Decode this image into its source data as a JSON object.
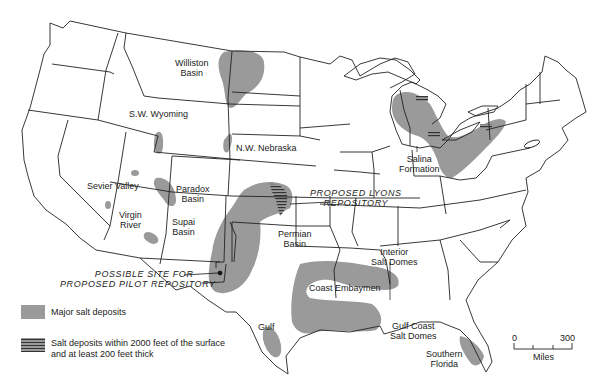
{
  "map": {
    "title": "Salt deposits of the United States",
    "fill_color": "#9a9a9a",
    "hatch_color": "#333333",
    "regions": [
      {
        "id": "williston",
        "label": "Williston\nBasin",
        "lines": [
          "Williston",
          "Basin"
        ]
      },
      {
        "id": "sw-wyoming",
        "label": "S.W. Wyoming"
      },
      {
        "id": "nw-nebraska",
        "label": "N.W. Nebraska"
      },
      {
        "id": "sevier-valley",
        "label": "Sevier Valley"
      },
      {
        "id": "paradox",
        "lines": [
          "Paradox",
          "Basin"
        ]
      },
      {
        "id": "virgin-river",
        "lines": [
          "Virgin",
          "River"
        ]
      },
      {
        "id": "supai",
        "lines": [
          "Supai",
          "Basin"
        ]
      },
      {
        "id": "permian",
        "lines": [
          "Permian",
          "Basin"
        ]
      },
      {
        "id": "salina",
        "lines": [
          "Salina",
          "Formation"
        ]
      },
      {
        "id": "interior-salt-domes",
        "lines": [
          "Interior",
          "Salt Domes"
        ]
      },
      {
        "id": "coast-embaymen",
        "label": "Coast Embaymen"
      },
      {
        "id": "gulf",
        "label": "Gulf"
      },
      {
        "id": "gulf-coast-salt-domes",
        "lines": [
          "Gulf Coast",
          "Salt Domes"
        ]
      },
      {
        "id": "southern-florida",
        "lines": [
          "Southern",
          "Florida"
        ]
      }
    ],
    "annotations": {
      "lyons": [
        "PROPOSED LYONS",
        "REPOSITORY"
      ],
      "pilot": [
        "POSSIBLE SITE FOR",
        "PROPOSED PILOT REPOSITORY"
      ]
    }
  },
  "legend": {
    "items": [
      {
        "swatch": "solid",
        "text": "Major salt deposits"
      },
      {
        "swatch": "hatched",
        "lines": [
          "Salt deposits within 2000 feet of the surface",
          "and at least 200 feet thick"
        ]
      }
    ]
  },
  "scale": {
    "min_label": "0",
    "max_label": "300",
    "unit": "Miles"
  }
}
